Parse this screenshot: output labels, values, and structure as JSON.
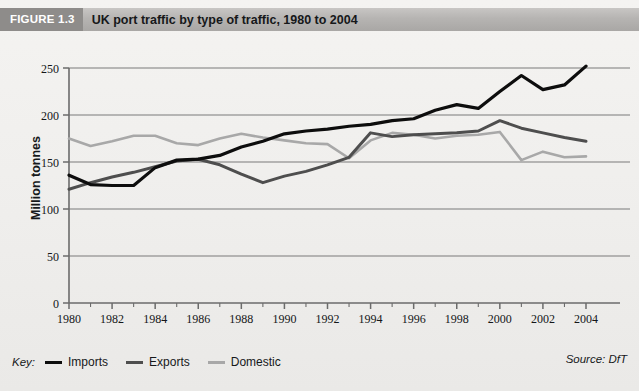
{
  "figure": {
    "badge": "FIGURE 1.3",
    "title": "UK port traffic by type of traffic, 1980 to 2004"
  },
  "key": {
    "label": "Key:",
    "entries": [
      {
        "name": "Imports",
        "color": "#0d0d0d",
        "width": 3.2
      },
      {
        "name": "Exports",
        "color": "#4e4e4e",
        "width": 3.0
      },
      {
        "name": "Domestic",
        "color": "#a8a8a8",
        "width": 2.6
      }
    ]
  },
  "source": "Source: DfT",
  "axes": {
    "y_title": "Million tonnes",
    "y_ticks": [
      "0",
      "50",
      "100",
      "150",
      "200",
      "250"
    ],
    "x_ticks": [
      "1980",
      "1982",
      "1984",
      "1986",
      "1988",
      "1990",
      "1992",
      "1994",
      "1996",
      "1998",
      "2000",
      "2002",
      "2004"
    ]
  },
  "colors": {
    "plate": "#f2f0ee",
    "titlebar": "#b6b4b2",
    "badge": "#8e8c8a",
    "axis": "#6b6b6b",
    "grid": "#7a7a7a",
    "text": "#16181a",
    "imports": "#0d0d0d",
    "exports": "#4e4e4e",
    "domestic": "#a8a8a8"
  },
  "chart_data": {
    "type": "line",
    "title": "UK port traffic by type of traffic, 1980 to 2004",
    "xlabel": "",
    "ylabel": "Million tonnes",
    "xlim": [
      1980,
      2004
    ],
    "ylim": [
      0,
      250
    ],
    "grid": true,
    "legend_position": "bottom-left",
    "source": "Source: DfT",
    "x": [
      1980,
      1981,
      1982,
      1983,
      1984,
      1985,
      1986,
      1987,
      1988,
      1989,
      1990,
      1991,
      1992,
      1993,
      1994,
      1995,
      1996,
      1997,
      1998,
      1999,
      2000,
      2001,
      2002,
      2003,
      2004
    ],
    "series": [
      {
        "name": "Imports",
        "color": "#0d0d0d",
        "values": [
          136,
          126,
          125,
          125,
          144,
          152,
          153,
          157,
          166,
          172,
          180,
          183,
          185,
          188,
          190,
          194,
          196,
          205,
          211,
          207,
          225,
          242,
          227,
          232,
          252
        ]
      },
      {
        "name": "Exports",
        "color": "#4e4e4e",
        "values": [
          121,
          128,
          134,
          139,
          145,
          151,
          153,
          147,
          137,
          128,
          135,
          140,
          147,
          155,
          181,
          177,
          179,
          180,
          181,
          183,
          194,
          186,
          181,
          176,
          172
        ]
      },
      {
        "name": "Domestic",
        "color": "#a8a8a8",
        "values": [
          175,
          167,
          172,
          178,
          178,
          170,
          168,
          175,
          180,
          176,
          173,
          170,
          169,
          154,
          173,
          181,
          179,
          175,
          178,
          179,
          182,
          152,
          161,
          155,
          156
        ]
      }
    ]
  }
}
